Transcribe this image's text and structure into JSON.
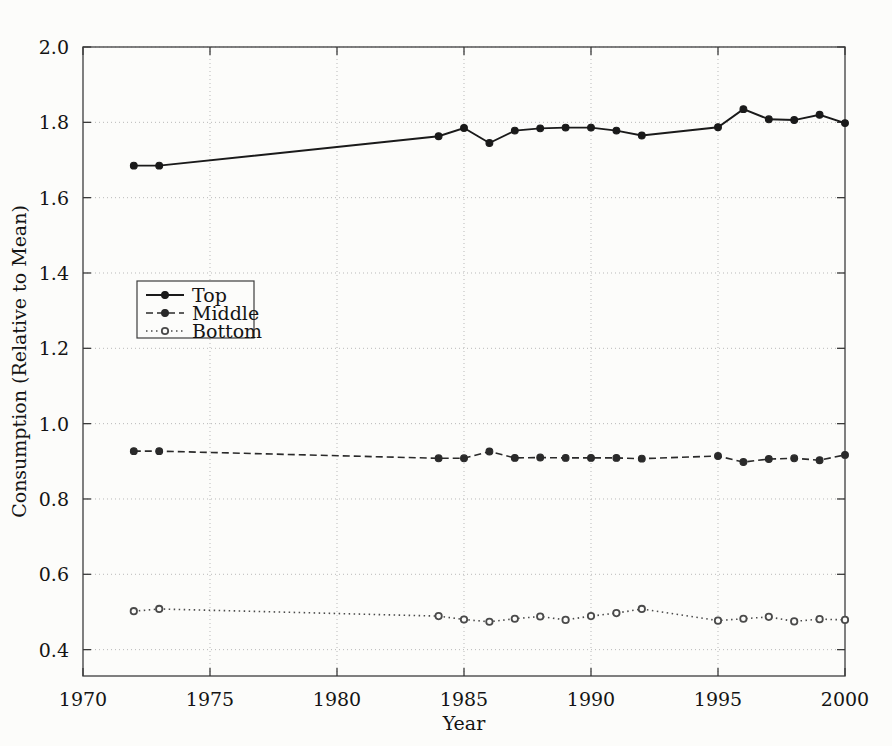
{
  "chart_data": {
    "type": "line",
    "title": "",
    "xlabel": "Year",
    "ylabel": "Consumption (Relative to Mean)",
    "xlim": [
      1970,
      2000
    ],
    "ylim": [
      0.33,
      2.0
    ],
    "grid": true,
    "legend_position": "center-left",
    "xticks": [
      1970,
      1975,
      1980,
      1985,
      1990,
      1995,
      2000
    ],
    "xtick_labels": [
      "1970",
      "1975",
      "1980",
      "1985",
      "1990",
      "1995",
      "2000"
    ],
    "yticks": [
      0.4,
      0.6,
      0.8,
      1.0,
      1.2,
      1.4,
      1.6,
      1.8,
      2.0
    ],
    "ytick_labels": [
      "0.4",
      "0.6",
      "0.8",
      "1.0",
      "1.2",
      "1.4",
      "1.6",
      "1.8",
      "2.0"
    ],
    "x": [
      1972,
      1973,
      1984,
      1985,
      1986,
      1987,
      1988,
      1989,
      1990,
      1991,
      1992,
      1995,
      1996,
      1997,
      1998,
      1999,
      2000
    ],
    "series": [
      {
        "name": "Top",
        "style": "solid",
        "color": "#1a1a1a",
        "marker": "filled-circle",
        "values": [
          1.685,
          1.685,
          1.763,
          1.785,
          1.745,
          1.778,
          1.784,
          1.786,
          1.786,
          1.778,
          1.765,
          1.787,
          1.835,
          1.808,
          1.806,
          1.82,
          1.798
        ]
      },
      {
        "name": "Middle",
        "style": "dashed",
        "color": "#2a2a2a",
        "marker": "filled-circle",
        "values": [
          0.927,
          0.927,
          0.908,
          0.908,
          0.926,
          0.909,
          0.91,
          0.909,
          0.909,
          0.909,
          0.907,
          0.914,
          0.898,
          0.906,
          0.908,
          0.903,
          0.917
        ]
      },
      {
        "name": "Bottom",
        "style": "dotted",
        "color": "#4a4a4a",
        "marker": "open-circle",
        "values": [
          0.502,
          0.508,
          0.489,
          0.48,
          0.474,
          0.482,
          0.488,
          0.479,
          0.489,
          0.497,
          0.508,
          0.477,
          0.482,
          0.487,
          0.475,
          0.481,
          0.479
        ]
      }
    ]
  },
  "legend": {
    "entries": [
      {
        "label": "Top"
      },
      {
        "label": "Middle"
      },
      {
        "label": "Bottom"
      }
    ]
  }
}
